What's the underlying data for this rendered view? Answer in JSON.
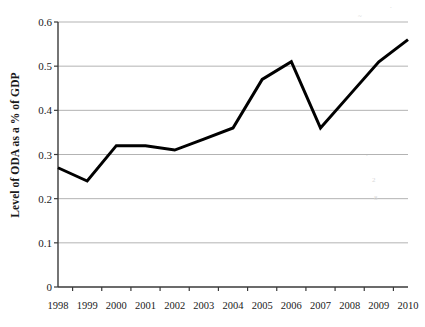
{
  "chart_data": {
    "type": "line",
    "title": "",
    "xlabel": "",
    "ylabel": "Level of ODA as a % of GDP",
    "categories": [
      "1998",
      "1999",
      "2000",
      "2001",
      "2002",
      "2003",
      "2004",
      "2005",
      "2006",
      "2007",
      "2008",
      "2009",
      "2010"
    ],
    "values": [
      0.27,
      0.24,
      0.32,
      0.32,
      0.31,
      0.335,
      0.36,
      0.47,
      0.51,
      0.36,
      0.435,
      0.51,
      0.56
    ],
    "series": [
      {
        "name": "Level of ODA as a % of GDP",
        "values": [
          0.27,
          0.24,
          0.32,
          0.32,
          0.31,
          0.335,
          0.36,
          0.47,
          0.51,
          0.36,
          0.435,
          0.51,
          0.56
        ]
      }
    ],
    "ylim": [
      0,
      0.6
    ],
    "ytick_labels": [
      "0",
      "0.1",
      "0.2",
      "0.3",
      "0.4",
      "0.5",
      "0.6"
    ],
    "ytick_values": [
      0,
      0.1,
      0.2,
      0.3,
      0.4,
      0.5,
      0.6
    ],
    "xtick_labels": [
      "1998",
      "1999",
      "2000",
      "2001",
      "2002",
      "2003",
      "2004",
      "2005",
      "2006",
      "2007",
      "2008",
      "2009",
      "2010"
    ],
    "grid": "horizontal",
    "legend": "none",
    "line_color": "#000000",
    "grid_color": "#b3b3b3",
    "axis_color": "#3a3a3a",
    "background_color": "#ffffff",
    "line_width": 3
  }
}
